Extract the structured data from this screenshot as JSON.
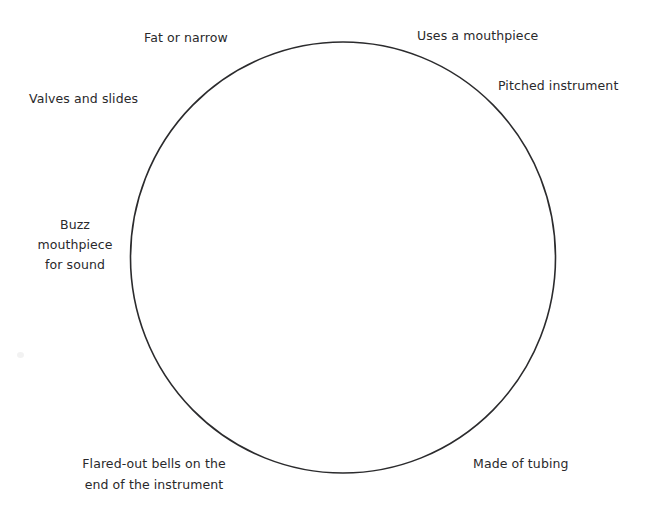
{
  "diagram": {
    "type": "circle-map",
    "background_color": "#ffffff",
    "shape": {
      "name": "main-circle",
      "kind": "ellipse",
      "center_x": 343,
      "center_y": 257,
      "radius_x": 212,
      "radius_y": 215,
      "stroke_color": "#2b2b2d",
      "stroke_width": 1.6,
      "fill": "none"
    },
    "labels": [
      {
        "id": "fat-or-narrow",
        "text": "Fat or narrow",
        "position": "top-left"
      },
      {
        "id": "uses-a-mouthpiece",
        "text": "Uses a mouthpiece",
        "position": "top-right"
      },
      {
        "id": "pitched-instrument",
        "text": "Pitched instrument",
        "position": "upper-right"
      },
      {
        "id": "valves-and-slides",
        "text": "Valves and slides",
        "position": "upper-left"
      },
      {
        "id": "buzz-mouthpiece-for-sound",
        "text": "Buzz\nmouthpiece\nfor sound",
        "line1": "Buzz",
        "line2": "mouthpiece",
        "line3": "for sound",
        "position": "left"
      },
      {
        "id": "flared-out-bells",
        "text": "Flared-out bells on the\nend of the instrument",
        "line1": "Flared-out bells on the",
        "line2": "end of the instrument",
        "position": "bottom-left"
      },
      {
        "id": "made-of-tubing",
        "text": "Made of tubing",
        "position": "bottom-right"
      }
    ],
    "text_color": "#29292b"
  }
}
